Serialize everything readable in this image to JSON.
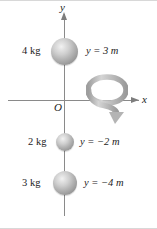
{
  "figure": {
    "background_color": "#ffffff",
    "axes": {
      "y_label": "y",
      "x_label": "x",
      "origin_label": "O",
      "axis_color": "#8a8a8a"
    },
    "rotation": {
      "name": "rotation-arrow",
      "about_axis": "y",
      "color": "#b8b8b8"
    },
    "masses": [
      {
        "id": "4kg",
        "mass_label": "4 kg",
        "position_label": "y = 3 m",
        "position_value": 3,
        "mass_value": 4,
        "units": {
          "mass": "kg",
          "position": "m"
        },
        "sphere_color": "#b4b4b4"
      },
      {
        "id": "2kg",
        "mass_label": "2 kg",
        "position_label": "y = −2 m",
        "position_value": -2,
        "mass_value": 2,
        "units": {
          "mass": "kg",
          "position": "m"
        },
        "sphere_color": "#b4b4b4"
      },
      {
        "id": "3kg",
        "mass_label": "3 kg",
        "position_label": "y = −4 m",
        "position_value": -4,
        "mass_value": 3,
        "units": {
          "mass": "kg",
          "position": "m"
        },
        "sphere_color": "#b4b4b4"
      }
    ]
  }
}
